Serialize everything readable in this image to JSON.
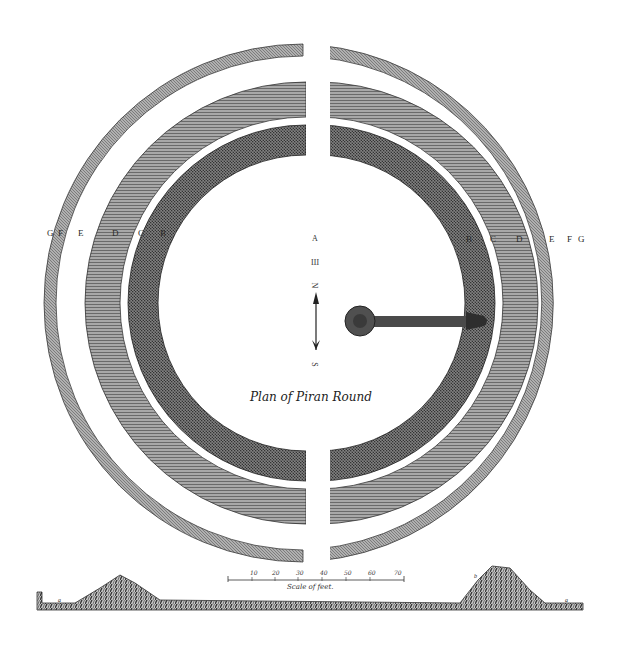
{
  "plate": {
    "title": "Plan of Piran Round",
    "left_labels": [
      "G",
      "F",
      "E",
      "D",
      "C",
      "B"
    ],
    "right_labels": [
      "B",
      "C",
      "D",
      "E",
      "F",
      "G"
    ],
    "compass": {
      "top_letter": "A",
      "mark": "Ш",
      "north_label": "N",
      "south_label": "S"
    },
    "scale": {
      "caption": "Scale of feet.",
      "ticks": [
        "10",
        "20",
        "30",
        "40",
        "50",
        "60",
        "70"
      ]
    },
    "section_labels": {
      "left_end": "a",
      "right_end": "a",
      "right_peak": "b"
    },
    "colors": {
      "ink": "#2b2b2b",
      "paper": "#ffffff",
      "ring_inner": "#4a4a4a",
      "ring_middle": "#8a8a8a",
      "ring_outer": "#8f8f8f"
    }
  }
}
